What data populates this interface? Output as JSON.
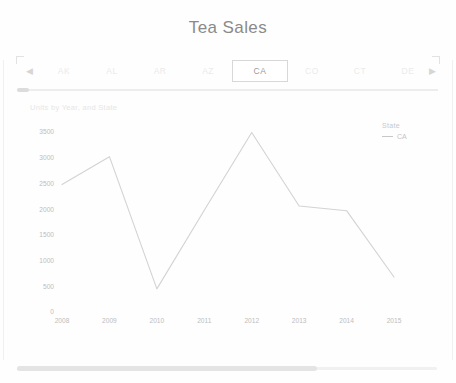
{
  "header": {
    "title": "Tea Sales"
  },
  "state_filter": {
    "prev_arrow": "◀",
    "next_arrow": "▶",
    "selected": "CA",
    "tabs": [
      {
        "label": "AK",
        "selected": false
      },
      {
        "label": "AL",
        "selected": false
      },
      {
        "label": "AR",
        "selected": false
      },
      {
        "label": "AZ",
        "selected": false
      },
      {
        "label": "CA",
        "selected": true
      },
      {
        "label": "CO",
        "selected": false
      },
      {
        "label": "CT",
        "selected": false
      },
      {
        "label": "DE",
        "selected": false
      }
    ]
  },
  "chart_data": {
    "type": "line",
    "title": "Units by Year, and State",
    "xlabel": "",
    "ylabel": "",
    "x": [
      "2008",
      "2009",
      "2010",
      "2011",
      "2012",
      "2013",
      "2014",
      "2015"
    ],
    "series": [
      {
        "name": "CA",
        "values": [
          2480,
          3020,
          450,
          1980,
          3490,
          2060,
          1970,
          680
        ],
        "color": "#d3d3d3"
      }
    ],
    "ylim": [
      0,
      3500
    ],
    "yticks": [
      3500,
      3000,
      2500,
      2000,
      1500,
      1000,
      500,
      0
    ],
    "grid": false,
    "legend": {
      "position": "right",
      "title": "State",
      "entries": [
        "CA"
      ]
    }
  },
  "scrollbars": {
    "filter_strip": "horizontal-scrollbar",
    "page_bottom": "horizontal-scrollbar"
  }
}
